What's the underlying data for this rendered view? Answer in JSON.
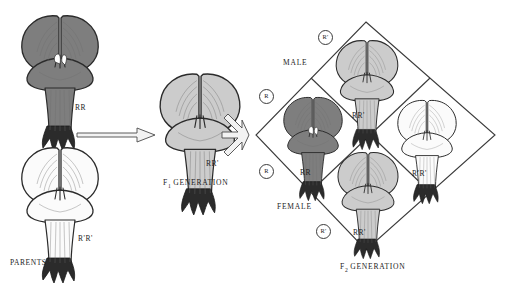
{
  "figure": {
    "stage_width": 517,
    "stage_height": 281
  },
  "colors": {
    "red_flower": "#7e7e7e",
    "pink_flower": "#cccccc",
    "white_flower": "#fbfbfb",
    "outline": "#2b2b2b",
    "text": "#1c1c1c",
    "background": "#ffffff"
  },
  "parents": {
    "section_label": "PARENTS",
    "red": {
      "genotype": "RR",
      "phenotype": "red"
    },
    "white": {
      "genotype": "R'R'",
      "phenotype": "white"
    }
  },
  "f1": {
    "section_label": "F",
    "section_label_sub": "1",
    "section_label_rest": " GENERATION",
    "offspring": {
      "genotype": "RR'",
      "phenotype": "pink"
    }
  },
  "f2": {
    "section_label": "F",
    "section_label_sub": "2",
    "section_label_rest": " GENERATION",
    "axis_male": "MALE",
    "axis_female": "FEMALE",
    "gametes_male": [
      {
        "allele": "R'",
        "position": "top"
      },
      {
        "allele": "R",
        "position": "upper-left"
      }
    ],
    "gametes_female": [
      {
        "allele": "R",
        "position": "lower-left"
      },
      {
        "allele": "R'",
        "position": "bottom"
      }
    ],
    "cells": [
      {
        "genotype": "RR'",
        "phenotype": "pink",
        "position": "top"
      },
      {
        "genotype": "RR",
        "phenotype": "red",
        "position": "left"
      },
      {
        "genotype": "R'R'",
        "phenotype": "white",
        "position": "right"
      },
      {
        "genotype": "RR'",
        "phenotype": "pink",
        "position": "bottom"
      }
    ]
  },
  "arrows": {
    "cross_arrow": "arrow-right",
    "fork_arrow": "arrow-fork"
  }
}
